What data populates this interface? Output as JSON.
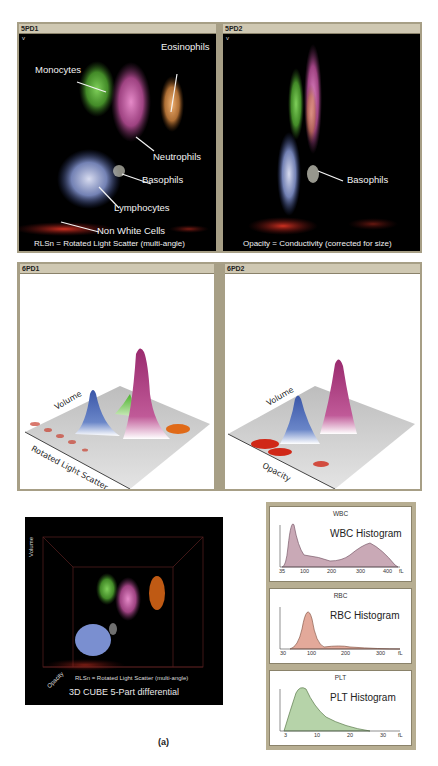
{
  "figure_label": "(a)",
  "scatter_panels": [
    {
      "id": "5PD1",
      "y_marker": "v",
      "caption": "RLSn = Rotated Light Scatter (multi-angle)",
      "labels": {
        "eosinophils": "Eosinophils",
        "monocytes": "Monocytes",
        "neutrophils": "Neutrophils",
        "basophils": "Basophils",
        "lymphocytes": "Lymphocytes",
        "non_white_cells": "Non White Cells"
      }
    },
    {
      "id": "5PD2",
      "y_marker": "v",
      "caption": "Opacity = Conductivity (corrected for size)",
      "labels": {
        "basophils": "Basophils"
      }
    }
  ],
  "surface_panels": [
    {
      "id": "6PD1",
      "axis_y": "Volume",
      "axis_x": "Rotated Light Scatter"
    },
    {
      "id": "6PD2",
      "axis_y": "Volume",
      "axis_x": "Opacity"
    }
  ],
  "cube": {
    "axis_volume": "Volume",
    "axis_opacity": "Opacity",
    "axis_caption": "RLSn = Rotated Light Scatter (multi-angle)",
    "title": "3D CUBE 5-Part differential"
  },
  "cell_colors": {
    "monocytes": "#5fb83a",
    "neutrophils": "#c24fa0",
    "eosinophils": "#e07a2a",
    "lymphocytes": "#7a8fd0",
    "basophils": "#e8e8e8",
    "non_white_cells": "#c0281e"
  },
  "histograms": [
    {
      "header": "WBC",
      "name": "WBC Histogram",
      "fill": "#c9a9b6",
      "ticks": [
        "35",
        "100",
        "200",
        "300",
        "400",
        "fL"
      ]
    },
    {
      "header": "RBC",
      "name": "RBC Histogram",
      "fill": "#e3a99a",
      "ticks": [
        "30",
        "100",
        "200",
        "300",
        "fL"
      ]
    },
    {
      "header": "PLT",
      "name": "PLT Histogram",
      "fill": "#b6d3a9",
      "ticks": [
        "3",
        "10",
        "20",
        "30",
        "fL"
      ]
    }
  ]
}
